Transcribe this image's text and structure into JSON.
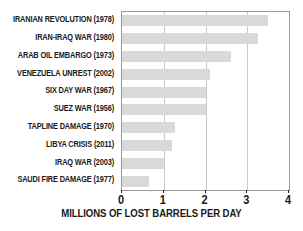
{
  "chart_data": {
    "type": "bar",
    "orientation": "horizontal",
    "title": "",
    "xlabel": "MILLIONS OF LOST BARRELS PER DAY",
    "ylabel": "",
    "xlim": [
      0,
      4
    ],
    "xticks": [
      0,
      1,
      2,
      3,
      4
    ],
    "xticklabels": [
      "0",
      "1",
      "2",
      "3",
      "4"
    ],
    "grid": true,
    "grid_axis": "x",
    "legend": false,
    "categories": [
      "IRANIAN REVOLUTION (1978)",
      "IRAN-IRAQ WAR (1980)",
      "ARAB OIL EMBARGO (1973)",
      "VENEZUELA UNREST (2002)",
      "SIX DAY WAR (1967)",
      "SUEZ WAR (1956)",
      "TAPLINE DAMAGE (1970)",
      "LIBYA CRISIS (2011)",
      "IRAQ WAR (2003)",
      "SAUDI FIRE DAMAGE (1977)"
    ],
    "values": [
      3.5,
      3.25,
      2.6,
      2.1,
      2.0,
      2.0,
      1.27,
      1.2,
      1.0,
      0.65
    ],
    "bar_color": "#d9d9d9",
    "axis_color": "#9a9a9a",
    "grid_color": "#c9c9c9",
    "text_color": "#1a1a1a"
  }
}
